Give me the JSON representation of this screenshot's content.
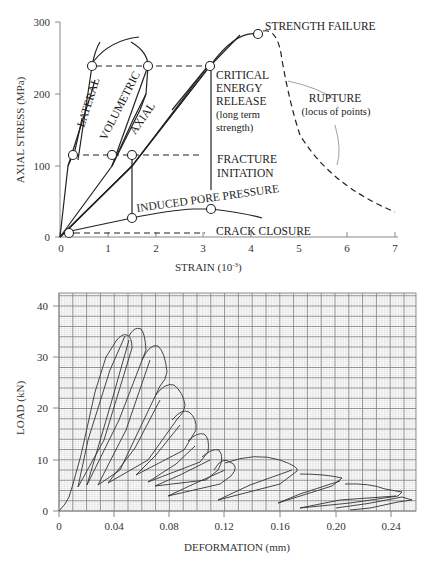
{
  "chart_data": [
    {
      "type": "line",
      "title": "",
      "xlabel": "STRAIN (10⁻³)",
      "ylabel": "AXIAL STRESS (MPa)",
      "xlim": [
        0,
        7
      ],
      "ylim": [
        0,
        300
      ],
      "x_ticks": [
        "0",
        "1",
        "2",
        "3",
        "4",
        "5",
        "6",
        "7"
      ],
      "y_ticks": [
        "0",
        "100",
        "200",
        "300"
      ],
      "grid": false,
      "series": [
        {
          "name": "AXIAL",
          "x": [
            0,
            1.5,
            3.1,
            4.1
          ],
          "y": [
            0,
            115,
            240,
            282
          ]
        },
        {
          "name": "VOLUMETRIC",
          "x": [
            0,
            1.1,
            1.8
          ],
          "y": [
            0,
            115,
            240
          ]
        },
        {
          "name": "LATERAL",
          "x": [
            0,
            0.25,
            0.6
          ],
          "y": [
            0,
            115,
            240
          ]
        },
        {
          "name": "INDUCED PORE PRESSURE",
          "x": [
            0.2,
            1.5,
            3.1,
            4.2
          ],
          "y": [
            8,
            28,
            42,
            35
          ]
        },
        {
          "name": "RUPTURE (post-peak, dashed)",
          "x": [
            4.1,
            4.6,
            5.8,
            7.0
          ],
          "y": [
            282,
            200,
            100,
            38
          ]
        }
      ],
      "annotations": [
        {
          "text": "STRENGTH FAILURE",
          "x": 4.1,
          "y": 282
        },
        {
          "text": "CRITICAL ENERGY RELEASE (long term strength)",
          "x": 3.1,
          "y": 240
        },
        {
          "text": "FRACTURE INITATION",
          "x": 3.1,
          "y": 115
        },
        {
          "text": "CRACK CLOSURE",
          "x": 0.2,
          "y": 8
        },
        {
          "text": "RUPTURE (locus of points)",
          "x": 5.8,
          "y": 140
        }
      ],
      "threshold_levels": {
        "crack_closure": 8,
        "fracture_initiation": 115,
        "critical_energy_release": 240,
        "strength_failure": 282
      }
    },
    {
      "type": "line",
      "title": "",
      "xlabel": "DEFORMATION (mm)",
      "ylabel": "LOAD (kN)",
      "xlim": [
        0,
        0.255
      ],
      "ylim": [
        0,
        43
      ],
      "x_ticks": [
        "0",
        "0.04",
        "0.08",
        "0.12",
        "0.16",
        "0.20",
        "0.24"
      ],
      "y_ticks": [
        "0",
        "10",
        "20",
        "30",
        "40"
      ],
      "grid": true,
      "series": [
        {
          "name": "cycle 1",
          "peak_load": 38.5,
          "peak_deformation": 0.055,
          "unload_to": [
            0.014,
            4.5
          ]
        },
        {
          "name": "cycle 2",
          "peak_load": 39.2,
          "peak_deformation": 0.072,
          "unload_to": [
            0.02,
            5
          ]
        },
        {
          "name": "cycle 3",
          "peak_load": 36.0,
          "peak_deformation": 0.082,
          "unload_to": [
            0.028,
            7
          ]
        },
        {
          "name": "cycle 4",
          "peak_load": 29.3,
          "peak_deformation": 0.092,
          "unload_to": [
            0.042,
            8
          ]
        },
        {
          "name": "cycle 5",
          "peak_load": 23.5,
          "peak_deformation": 0.102,
          "unload_to": [
            0.054,
            7.5
          ]
        },
        {
          "name": "cycle 6",
          "peak_load": 18.0,
          "peak_deformation": 0.115,
          "unload_to": [
            0.073,
            7.5
          ]
        },
        {
          "name": "cycle 7",
          "peak_load": 13.5,
          "peak_deformation": 0.125,
          "unload_to": [
            0.08,
            4.5
          ]
        },
        {
          "name": "cycle 8",
          "peak_load": 8.5,
          "peak_deformation": 0.155,
          "unload_to": [
            0.098,
            2.5
          ]
        },
        {
          "name": "cycle 9",
          "peak_load": 7.2,
          "peak_deformation": 0.19,
          "unload_to": [
            0.15,
            2
          ]
        },
        {
          "name": "cycle 10",
          "peak_load": 5.0,
          "peak_deformation": 0.225,
          "unload_to": [
            0.19,
            2
          ]
        },
        {
          "name": "cycle 11",
          "peak_load": 3.5,
          "peak_deformation": 0.25,
          "unload_to": [
            0.2,
            0
          ]
        }
      ]
    }
  ],
  "top": {
    "y_title": "AXIAL STRESS (MPa)",
    "x_title": "STRAIN (10",
    "x_title_sup": "-3",
    "x_title_end": ")",
    "y_ticks": [
      "0",
      "100",
      "200",
      "300"
    ],
    "x_ticks": [
      "0",
      "1",
      "2",
      "3",
      "4",
      "5",
      "6",
      "7"
    ],
    "labels": {
      "lateral": "LATERAL",
      "volumetric": "VOLUMETRIC",
      "axial": "AXIAL",
      "strength_failure": "STRENGTH FAILURE",
      "critical_1": "CRITICAL",
      "critical_2": "ENERGY",
      "critical_3": "RELEASE",
      "critical_4": "(long term",
      "critical_5": "strength)",
      "fracture_1": "FRACTURE",
      "fracture_2": "INITATION",
      "pore": "INDUCED PORE PRESSURE",
      "crack": "CRACK CLOSURE",
      "rupture_1": "RUPTURE",
      "rupture_2": "(locus of points)"
    }
  },
  "bottom": {
    "y_title": "LOAD (kN)",
    "x_title": "DEFORMATION (mm)",
    "y_ticks": [
      "0",
      "10",
      "20",
      "30",
      "40"
    ],
    "x_ticks": [
      "0",
      "0.04",
      "0.08",
      "0.12",
      "0.16",
      "0.20",
      "0.24"
    ]
  }
}
